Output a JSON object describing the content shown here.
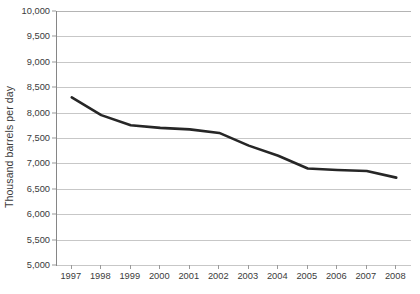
{
  "chart_data": {
    "type": "line",
    "title": "",
    "xlabel": "",
    "ylabel": "Thousand barrels per day",
    "categories": [
      "1997",
      "1998",
      "1999",
      "2000",
      "2001",
      "2002",
      "2003",
      "2004",
      "2005",
      "2006",
      "2007",
      "2008"
    ],
    "x": [
      1997,
      1998,
      1999,
      2000,
      2001,
      2002,
      2003,
      2004,
      2005,
      2006,
      2007,
      2008
    ],
    "values": [
      8300,
      7950,
      7750,
      7700,
      7670,
      7600,
      7350,
      7150,
      6900,
      6870,
      6850,
      6720
    ],
    "series": [
      {
        "name": "Thousand barrels per day",
        "values": [
          8300,
          7950,
          7750,
          7700,
          7670,
          7600,
          7350,
          7150,
          6900,
          6870,
          6850,
          6720
        ]
      }
    ],
    "ylim": [
      5000,
      10000
    ],
    "ytick_labels": [
      "10,000",
      "9,500",
      "9,000",
      "8,500",
      "8,000",
      "7,500",
      "7,000",
      "6,500",
      "6,000",
      "5,500",
      "5,000"
    ],
    "ytick_values": [
      10000,
      9500,
      9000,
      8500,
      8000,
      7500,
      7000,
      6500,
      6000,
      5500,
      5000
    ],
    "grid": true,
    "legend": "none",
    "line_color": "#262626",
    "grid_color": "#c7c7c7",
    "axis_color": "#868686",
    "background_color": "#ffffff",
    "text_color": "#3b3b3b"
  }
}
